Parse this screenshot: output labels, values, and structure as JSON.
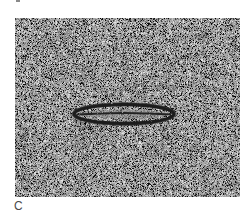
{
  "figure": {
    "panel_label": "C",
    "top_label_fragment": "",
    "micrograph": {
      "description": "Electron micrograph showing an elongated spindle-shaped particle with dark outline and central dark line on a noisy stained background",
      "background_color": "#9c9c9c",
      "particle_color": "#1e1e1e",
      "particle": {
        "shape": "elongated ellipse",
        "center_x": 124,
        "center_y": 114,
        "length": 104,
        "width": 22
      }
    }
  }
}
